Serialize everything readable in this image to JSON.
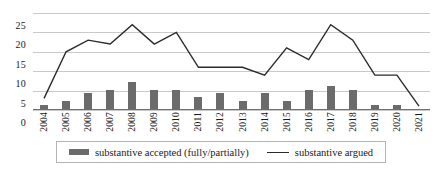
{
  "chart_data": {
    "type": "bar",
    "title": "",
    "xlabel": "",
    "ylabel": "",
    "ylim": [
      0,
      25
    ],
    "yticks": [
      0,
      5,
      10,
      15,
      20,
      25
    ],
    "grid": true,
    "legend_position": "bottom",
    "categories": [
      "2004",
      "2005",
      "2006",
      "2007",
      "2008",
      "2009",
      "2010",
      "2011",
      "2012",
      "2013",
      "2014",
      "2015",
      "2016",
      "2017",
      "2018",
      "2019",
      "2020",
      "2021"
    ],
    "series": [
      {
        "name": "substantive accepted (fully/partially)",
        "type": "bar",
        "color": "#6b6b6b",
        "values": [
          1,
          2,
          4,
          5,
          7,
          5,
          5,
          3,
          4,
          2,
          4,
          2,
          5,
          6,
          5,
          1,
          1,
          0
        ]
      },
      {
        "name": "substantive argued",
        "type": "line",
        "color": "#2b2b2b",
        "values": [
          3,
          15,
          18,
          17,
          22,
          17,
          20,
          11,
          11,
          11,
          9,
          16,
          13,
          22,
          18,
          9,
          9,
          1
        ]
      }
    ]
  },
  "legend": {
    "entries": [
      {
        "label": "substantive accepted (fully/partially)",
        "marker": "bar-swatch"
      },
      {
        "label": "substantive argued",
        "marker": "line-swatch"
      }
    ]
  }
}
